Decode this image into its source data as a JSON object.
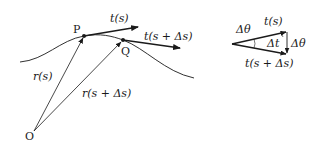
{
  "diagram": {
    "main": {
      "points": {
        "O": {
          "label": "O",
          "x": 34,
          "y": 131
        },
        "P": {
          "label": "P",
          "x": 84,
          "y": 36
        },
        "Q": {
          "label": "Q",
          "x": 123,
          "y": 40
        }
      },
      "labels": {
        "r_s": "r(s)",
        "r_s_ds": "r(s + Δs)",
        "t_s": "t(s)",
        "t_s_ds": "t(s + Δs)"
      }
    },
    "triangle": {
      "labels": {
        "dtheta_top": "Δθ",
        "t_s": "t(s)",
        "dt": "Δt",
        "dtheta_right": "Δθ",
        "t_s_ds": "t(s + Δs)"
      }
    },
    "colors": {
      "stroke": "#1a1a1a",
      "background": "#ffffff"
    }
  }
}
